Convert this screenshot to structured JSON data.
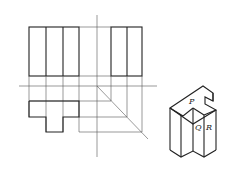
{
  "figure": {
    "labels": {
      "p": "P",
      "q": "Q",
      "r": "R"
    }
  }
}
